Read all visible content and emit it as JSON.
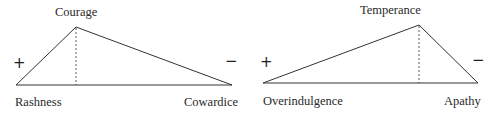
{
  "diagrams": [
    {
      "virtue": "Courage",
      "left_vice": "Rashness",
      "right_vice": "Cowardice",
      "plus_sign": "+",
      "minus_sign": "−"
    },
    {
      "virtue": "Temperance",
      "left_vice": "Overindulgence",
      "right_vice": "Apathy",
      "plus_sign": "+",
      "minus_sign": "−"
    }
  ],
  "colors": {
    "line": "#333333",
    "text": "#2a2a2a"
  }
}
